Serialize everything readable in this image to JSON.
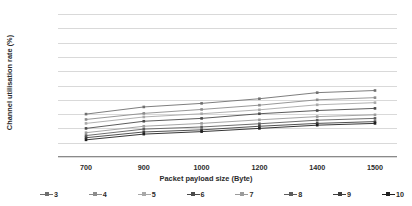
{
  "chart_data": {
    "type": "line",
    "title": "",
    "subtitle": "",
    "xlabel": "Packet payload size (Byte)",
    "ylabel": "Channel utilisation rate (%)",
    "categories": [
      700,
      900,
      1000,
      1200,
      1400,
      1500
    ],
    "x_tick_labels": [
      "700",
      "900",
      "1000",
      "1200",
      "1400",
      "1500"
    ],
    "y_tick_labels": [
      "50%",
      "46%",
      "42%",
      "38%",
      "34%",
      "30%",
      "26%",
      "22%",
      "18%",
      "14%",
      "10%"
    ],
    "y_tick_values": [
      50,
      46,
      42,
      38,
      34,
      30,
      26,
      22,
      18,
      14,
      10
    ],
    "ylim": [
      10,
      50
    ],
    "y_tick_step": 4,
    "grid": "horizontal",
    "legend_position": "bottom",
    "legend_title": "",
    "series": [
      {
        "name": "3",
        "values": [
          22.0,
          24.0,
          25.0,
          26.3,
          28.0,
          28.6
        ],
        "color": "#6f6f6f",
        "marker": "square"
      },
      {
        "name": "4",
        "values": [
          20.5,
          22.2,
          23.3,
          24.5,
          26.0,
          26.6
        ],
        "color": "#8c8c8c",
        "marker": "square"
      },
      {
        "name": "5",
        "values": [
          19.4,
          21.2,
          22.1,
          23.2,
          24.6,
          25.2
        ],
        "color": "#a8a8a8",
        "marker": "square"
      },
      {
        "name": "6",
        "values": [
          18.0,
          20.0,
          20.8,
          22.1,
          23.0,
          23.6
        ],
        "color": "#4a4a4a",
        "marker": "square"
      },
      {
        "name": "7",
        "values": [
          16.8,
          18.6,
          19.4,
          20.4,
          21.3,
          21.8
        ],
        "color": "#9b9b9b",
        "marker": "square"
      },
      {
        "name": "8",
        "values": [
          16.0,
          17.8,
          18.4,
          19.3,
          20.3,
          20.8
        ],
        "color": "#5c5c5c",
        "marker": "square"
      },
      {
        "name": "9",
        "values": [
          15.4,
          17.0,
          17.6,
          18.6,
          19.4,
          19.9
        ],
        "color": "#3d3d3d",
        "marker": "square"
      },
      {
        "name": "10",
        "values": [
          14.8,
          16.4,
          17.1,
          18.0,
          18.9,
          19.4
        ],
        "color": "#1f1f1f",
        "marker": "square"
      }
    ]
  },
  "axes": {
    "y_title": "Channel utilisation rate (%)",
    "x_title": "Packet payload size (Byte)"
  }
}
